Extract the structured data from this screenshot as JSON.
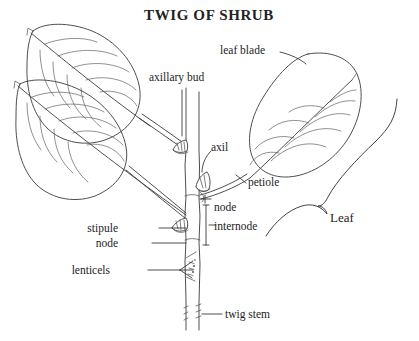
{
  "figure": {
    "title": "TWIG OF SHRUB",
    "background_color": "#ffffff",
    "ink_color": "#333333"
  },
  "labels": {
    "title": "TWIG OF SHRUB",
    "axillary_bud": "axillary bud",
    "leaf_blade": "leaf blade",
    "axil": "axil",
    "petiole": "petiole",
    "node_upper": "node",
    "internode": "internode",
    "stipule": "stipule",
    "node_lower": "node",
    "lenticels": "lenticels",
    "twig_stem": "twig stem",
    "leaf_bracket": "Leaf"
  },
  "parts": [
    {
      "name": "leaf-blade",
      "label": "leaf blade"
    },
    {
      "name": "petiole",
      "label": "petiole"
    },
    {
      "name": "axil",
      "label": "axil"
    },
    {
      "name": "axillary-bud",
      "label": "axillary bud"
    },
    {
      "name": "node",
      "label": "node"
    },
    {
      "name": "internode",
      "label": "internode"
    },
    {
      "name": "stipule",
      "label": "stipule"
    },
    {
      "name": "lenticels",
      "label": "lenticels"
    },
    {
      "name": "twig-stem",
      "label": "twig stem"
    },
    {
      "name": "leaf",
      "label": "Leaf"
    }
  ]
}
